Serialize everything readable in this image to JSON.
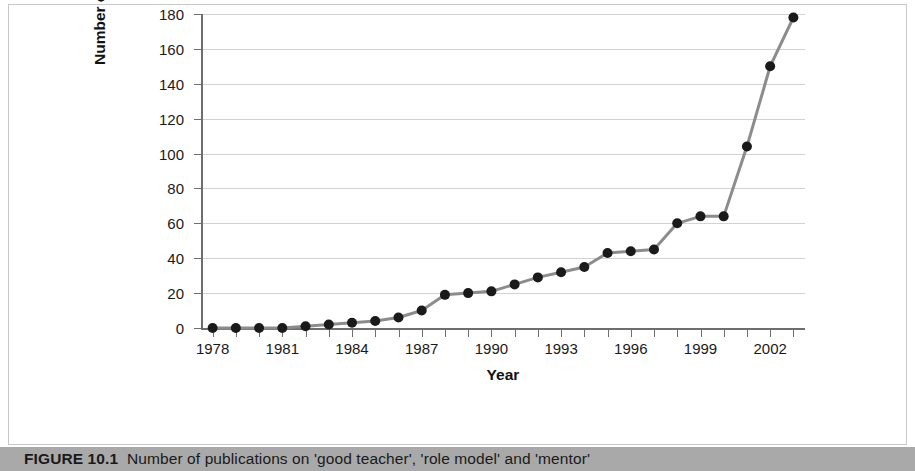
{
  "caption": {
    "figure_label": "FIGURE 10.1",
    "text": "Number of publications on 'good teacher', 'role model' and 'mentor'"
  },
  "colors": {
    "line": "#8c8c8c",
    "marker": "#1a1a1a",
    "grid": "#d2d2d2",
    "axis": "#6e6e6e",
    "caption_bar": "#a9a9a9",
    "panel_border": "#c8c8c8",
    "background": "#ffffff"
  },
  "chart_data": {
    "type": "line",
    "title": "",
    "xlabel": "Year",
    "ylabel": "Number of publications",
    "xlim": [
      1977.5,
      2003.5
    ],
    "ylim": [
      0,
      180
    ],
    "grid": true,
    "legend": "none",
    "ytick_values": [
      0,
      20,
      40,
      60,
      80,
      100,
      120,
      140,
      160,
      180
    ],
    "ytick_labels": [
      "0",
      "20",
      "40",
      "60",
      "80",
      "100",
      "120",
      "140",
      "160",
      "180"
    ],
    "xtick_values": [
      1978,
      1981,
      1984,
      1987,
      1990,
      1993,
      1996,
      1999,
      2002
    ],
    "xtick_labels": [
      "1978",
      "1981",
      "1984",
      "1987",
      "1990",
      "1993",
      "1996",
      "1999",
      "2002"
    ],
    "x": [
      1978,
      1979,
      1980,
      1981,
      1982,
      1983,
      1984,
      1985,
      1986,
      1987,
      1988,
      1989,
      1990,
      1991,
      1992,
      1993,
      1994,
      1995,
      1996,
      1997,
      1998,
      1999,
      2000,
      2001,
      2002,
      2003
    ],
    "values": [
      0,
      0,
      0,
      0,
      1,
      2,
      3,
      4,
      6,
      10,
      19,
      20,
      21,
      25,
      29,
      32,
      35,
      43,
      44,
      45,
      60,
      64,
      64,
      104,
      150,
      178
    ],
    "series": [
      {
        "name": "Number of publications",
        "marker": "filled-circle",
        "values": [
          0,
          0,
          0,
          0,
          1,
          2,
          3,
          4,
          6,
          10,
          19,
          20,
          21,
          25,
          29,
          32,
          35,
          43,
          44,
          45,
          60,
          64,
          64,
          104,
          150,
          178
        ]
      }
    ]
  }
}
